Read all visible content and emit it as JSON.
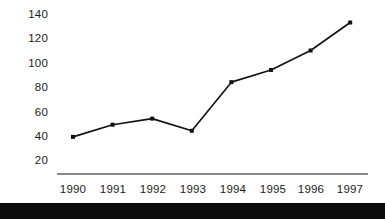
{
  "chart_data": {
    "type": "line",
    "title": "",
    "subtitle": "",
    "xlabel": "",
    "ylabel": "",
    "categories": [
      "1990",
      "1991",
      "1992",
      "1993",
      "1994",
      "1995",
      "1996",
      "1997"
    ],
    "values": [
      39,
      49,
      54,
      44,
      84,
      94,
      110,
      133
    ],
    "series": [
      {
        "name": "series-1",
        "values": [
          39,
          49,
          54,
          44,
          84,
          94,
          110,
          133
        ]
      }
    ],
    "y_ticks": [
      20,
      40,
      60,
      80,
      100,
      120,
      140
    ],
    "ylim": [
      20,
      140
    ],
    "grid": false,
    "legend": false,
    "legend_position": "none",
    "marker": "square",
    "line_color": "#111111",
    "marker_color": "#111111",
    "axis_color": "#8a8a8a",
    "background_color": "#ffffff",
    "annotations": []
  },
  "axis": {
    "y_labels": [
      "140",
      "120",
      "100",
      "80",
      "60",
      "40",
      "20"
    ],
    "x_labels": [
      "1990",
      "1991",
      "1992",
      "1993",
      "1994",
      "1995",
      "1996",
      "1997"
    ]
  },
  "footer": {
    "bar_color": "#0b0b0b"
  }
}
